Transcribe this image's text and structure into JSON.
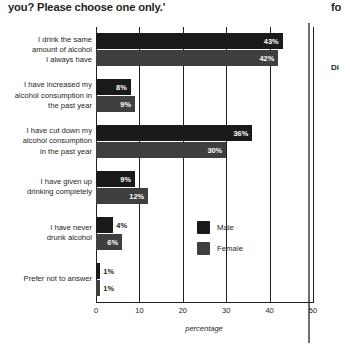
{
  "heading": {
    "text": "you? Please choose one only.'"
  },
  "bleed": {
    "top_fragment": "fo",
    "mid_fragment": "Di"
  },
  "chart_data": {
    "type": "bar",
    "orientation": "horizontal",
    "title": "",
    "xlabel": "percentage",
    "ylabel": "",
    "xlim": [
      0,
      50
    ],
    "xticks": [
      0,
      10,
      20,
      30,
      40,
      50
    ],
    "grid": true,
    "legend_position": "inside-right",
    "categories": [
      "I drink the same amount of alcohol I always have",
      "I have increased my alcohol consumption in the past year",
      "I have cut down my alcohol consumption in the past year",
      "I have given up drinking completely",
      "I have never drunk alcohol",
      "Prefer not to answer"
    ],
    "category_lines": [
      [
        "I drink the same",
        "amount of alcohol",
        "I always have"
      ],
      [
        "I have increased my",
        "alcohol consumption in",
        "the past year"
      ],
      [
        "I have cut down my",
        "alcohol consumption",
        "in the past year"
      ],
      [
        "I have given up",
        "drinking completely"
      ],
      [
        "I have never",
        "drunk alcohol"
      ],
      [
        "Prefer not to answer"
      ]
    ],
    "series": [
      {
        "name": "Male",
        "color": "#1a1a1a",
        "values": [
          43,
          8,
          36,
          9,
          4,
          1
        ],
        "labels": [
          "43%",
          "8%",
          "36%",
          "9%",
          "4%",
          "1%"
        ]
      },
      {
        "name": "Female",
        "color": "#3f3f3f",
        "values": [
          42,
          9,
          30,
          12,
          6,
          1
        ],
        "labels": [
          "42%",
          "9%",
          "30%",
          "12%",
          "6%",
          "1%"
        ]
      }
    ]
  }
}
